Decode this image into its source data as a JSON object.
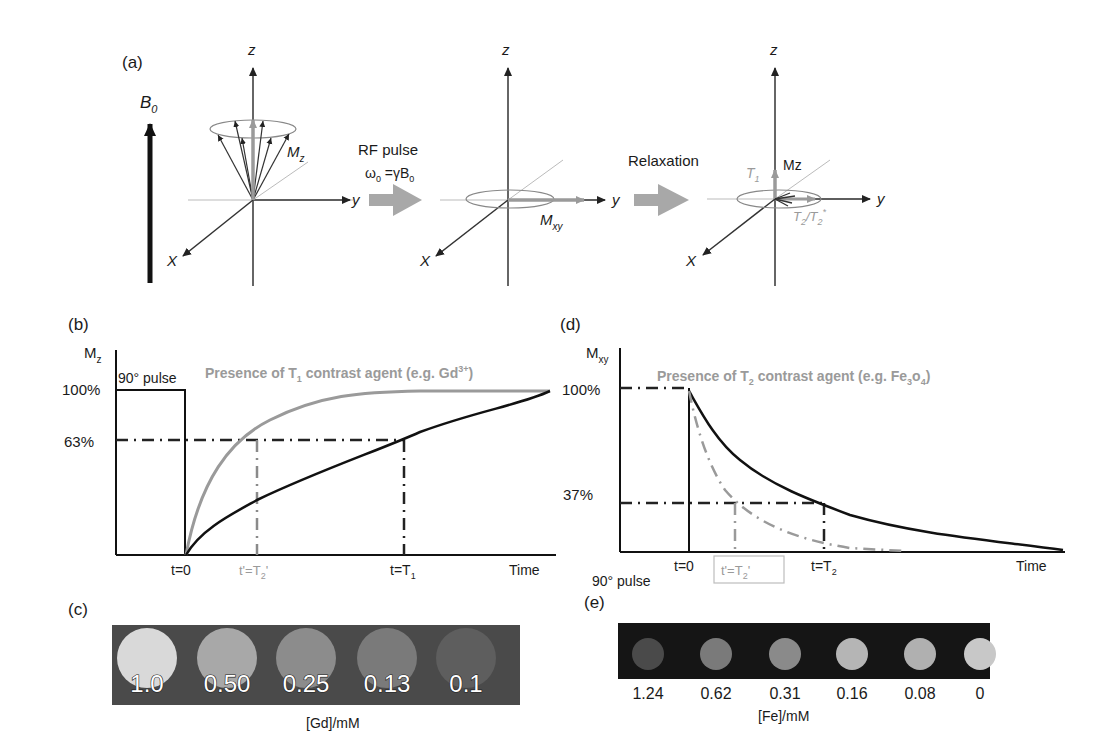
{
  "panels": {
    "a": {
      "label": "(a)",
      "b0_label": "B",
      "b0_sub": "0",
      "axis_z": "z",
      "axis_y": "y",
      "axis_x": "X",
      "mz_label": "M",
      "mz_sub": "z",
      "rf_pulse_label": "RF pulse",
      "larmor_omega": "ω",
      "larmor_omega_sub": "0",
      "larmor_eq": " =γB",
      "larmor_b_sub": "0",
      "mxy_label": "M",
      "mxy_sub": "xy",
      "relaxation_label": "Relaxation",
      "t1_label": "T",
      "t1_sub": "1",
      "mz_plain": "Mz",
      "t2_label": "T",
      "t2_sub": "2",
      "t2_slash": "/T",
      "t2p_sub": "2",
      "t2p_sup": "*"
    },
    "b": {
      "label": "(b)",
      "ylabel": "M",
      "ylabel_sub": "z",
      "y100": "100%",
      "y63": "63%",
      "pulse_label": "90° pulse",
      "agent_text_pre": "Presence of T",
      "agent_sub": "1",
      "agent_text_post": " contrast agent (e.g. Gd",
      "agent_sup": "3+",
      "agent_close": ")",
      "x_t0": "t=0",
      "x_t2p": "t'=T",
      "x_t2p_sub": "2",
      "x_t2p_prime": "'",
      "x_t1": "t=T",
      "x_t1_sub": "1",
      "x_time": "Time"
    },
    "c": {
      "label": "(c)",
      "concentrations": [
        "1.0",
        "0.50",
        "0.25",
        "0.13",
        "0.1"
      ],
      "intensities": [
        "#d9d9d9",
        "#a8a8a8",
        "#8c8c8c",
        "#7a7a7a",
        "#5e5e5e"
      ],
      "xlabel": "[Gd]/mM"
    },
    "d": {
      "label": "(d)",
      "ylabel": "M",
      "ylabel_sub": "xy",
      "y100": "100%",
      "y37": "37%",
      "agent_text_pre": "Presence of T",
      "agent_sub": "2",
      "agent_text_post": " contrast agent (e.g. Fe",
      "agent_sub2": "3",
      "agent_o": "o",
      "agent_sub3": "4",
      "agent_close": ")",
      "x_t0": "t=0",
      "x_t2p": "t'=T",
      "x_t2p_sub": "2",
      "x_t2p_prime": "'",
      "x_t2": "t=T",
      "x_t2_sub": "2",
      "x_time": "Time",
      "pulse_label": "90° pulse"
    },
    "e": {
      "label": "(e)",
      "concentrations": [
        "1.24",
        "0.62",
        "0.31",
        "0.16",
        "0.08",
        "0"
      ],
      "intensities": [
        "#4a4a4a",
        "#7a7a7a",
        "#8a8a8a",
        "#b5b5b5",
        "#b0b0b0",
        "#c8c8c8"
      ],
      "xlabel": "[Fe]/mM"
    }
  },
  "colors": {
    "ink": "#1a1a1a",
    "grey_curve": "#9a9a9a",
    "arrow_grey": "#a6a6a6",
    "phantom_bg_c": "#4a4a4a",
    "phantom_bg_e": "#151515"
  }
}
